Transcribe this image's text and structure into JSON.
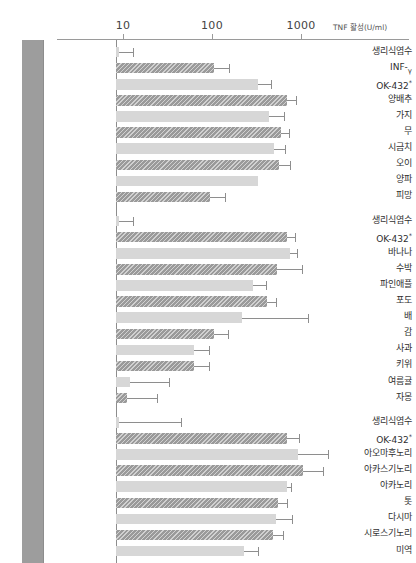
{
  "chart": {
    "type": "bar",
    "orientation": "horizontal",
    "axis_caption": "TNF 활성(U/ml)",
    "xscale": "log",
    "xlim": [
      3,
      4000
    ],
    "ticks": [
      {
        "value": 10,
        "label": "10"
      },
      {
        "value": 100,
        "label": "100"
      },
      {
        "value": 1000,
        "label": "1000"
      }
    ],
    "groups": [
      {
        "name": "채소",
        "chars": [
          "채",
          "소"
        ]
      },
      {
        "name": "과일",
        "chars": [
          "과",
          "일"
        ]
      },
      {
        "name": "해조류",
        "chars": [
          "해",
          "조",
          "류"
        ]
      }
    ]
  },
  "chart_data": {
    "type": "bar",
    "title": "",
    "xlabel": "TNF 활성(U/ml)",
    "ylabel": "",
    "xscale": "log",
    "xlim": [
      3,
      4000
    ],
    "grid": false,
    "legend": "none",
    "orientation": "horizontal",
    "groups": [
      {
        "group": "채소",
        "categories": [
          "생리식염수",
          "INF-γ",
          "OK-432*",
          "양배추",
          "가지",
          "무",
          "시금치",
          "오이",
          "양파",
          "피망"
        ],
        "values": [
          9,
          105,
          330,
          700,
          440,
          600,
          500,
          570,
          330,
          95
        ],
        "errors_high": [
          13,
          155,
          460,
          880,
          640,
          740,
          660,
          760,
          240,
          140
        ],
        "shades": [
          "light",
          "dark",
          "light",
          "dark",
          "light",
          "dark",
          "light",
          "dark",
          "light",
          "dark"
        ]
      },
      {
        "group": "과일",
        "categories": [
          "생리식염수",
          "OK-432*",
          "바나나",
          "수박",
          "파인애플",
          "포도",
          "배",
          "감",
          "사과",
          "키위",
          "여름귤",
          "자몽"
        ],
        "values": [
          9,
          700,
          760,
          540,
          290,
          410,
          220,
          105,
          62,
          62,
          12,
          11
        ],
        "errors_high": [
          13,
          860,
          900,
          1020,
          400,
          520,
          1200,
          150,
          92,
          92,
          33,
          24
        ],
        "shades": [
          "light",
          "dark",
          "light",
          "dark",
          "light",
          "dark",
          "light",
          "dark",
          "light",
          "dark",
          "light",
          "dark"
        ]
      },
      {
        "group": "해조류",
        "categories": [
          "생리식염수",
          "OK-432*",
          "아오마후노리",
          "아카스기노리",
          "아카노리",
          "톳",
          "다시마",
          "시로스기노리",
          "미역"
        ],
        "values": [
          9,
          700,
          920,
          1050,
          690,
          550,
          520,
          480,
          230
        ],
        "errors_high": [
          45,
          950,
          2000,
          1750,
          780,
          700,
          790,
          620,
          330
        ],
        "shades": [
          "light",
          "dark",
          "light",
          "dark",
          "light",
          "dark",
          "light",
          "dark",
          "light"
        ]
      }
    ]
  },
  "colors": {
    "bar_dark": "#9a9a9a",
    "bar_light": "#d7d7d7",
    "group_band": "#9d9d9d",
    "axis": "#8d8d8d",
    "text": "#2f2f2f"
  }
}
